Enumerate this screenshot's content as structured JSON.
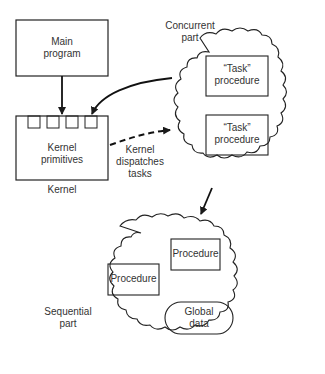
{
  "header": {
    "page_fragment": "20"
  },
  "diagram": {
    "main_program": {
      "label_line1": "Main",
      "label_line2": "program"
    },
    "kernel": {
      "box_line1": "Kernel",
      "box_line2": "primitives",
      "caption": "Kernel",
      "slot_count": 4
    },
    "dispatch_label": {
      "line1": "Kernel",
      "line2": "dispatches",
      "line3": "tasks"
    },
    "concurrent_part": {
      "caption_line1": "Concurrent",
      "caption_line2": "part",
      "tasks": [
        {
          "line1": "“Task”",
          "line2": "procedure"
        },
        {
          "line1": "“Task”",
          "line2": "procedure"
        }
      ]
    },
    "sequential_part": {
      "caption_line1": "Sequential",
      "caption_line2": "part",
      "procedures": [
        {
          "label": "Procedure"
        },
        {
          "label": "Procedure"
        }
      ],
      "global_data": {
        "line1": "Global",
        "line2": "data"
      }
    }
  }
}
